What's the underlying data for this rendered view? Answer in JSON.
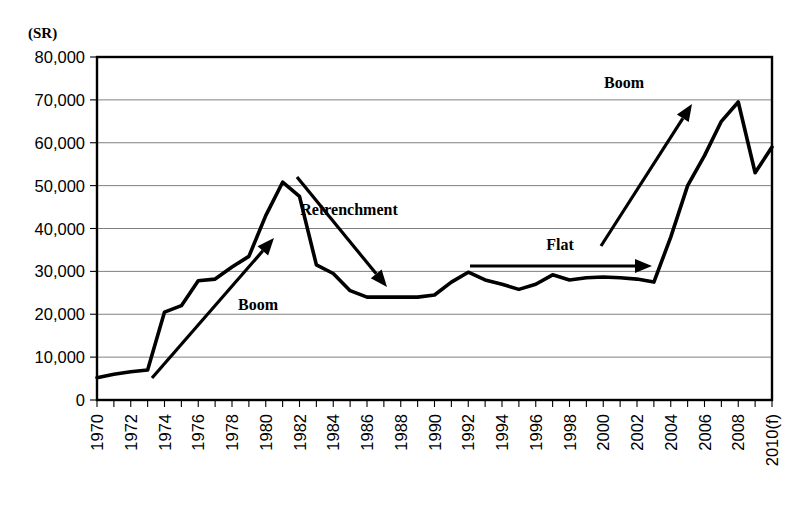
{
  "chart_data": {
    "type": "line",
    "title": "",
    "xlabel": "",
    "ylabel": "(SR)",
    "yunit_label": "(SR)",
    "ylim": [
      0,
      80000
    ],
    "ytick_values": [
      0,
      10000,
      20000,
      30000,
      40000,
      50000,
      60000,
      70000,
      80000
    ],
    "ytick_labels": [
      "0",
      "10,000",
      "20,000",
      "30,000",
      "40,000",
      "50,000",
      "60,000",
      "70,000",
      "80,000"
    ],
    "grid": true,
    "legend": "none",
    "xlim": [
      1970,
      2010
    ],
    "x": [
      1970,
      1971,
      1972,
      1973,
      1974,
      1975,
      1976,
      1977,
      1978,
      1979,
      1980,
      1981,
      1982,
      1983,
      1984,
      1985,
      1986,
      1987,
      1988,
      1989,
      1990,
      1991,
      1992,
      1993,
      1994,
      1995,
      1996,
      1997,
      1998,
      1999,
      2000,
      2001,
      2002,
      2003,
      2004,
      2005,
      2006,
      2007,
      2008,
      2009,
      2010
    ],
    "xtick_labels": [
      "1970",
      "",
      "1972",
      "",
      "1974",
      "",
      "1976",
      "",
      "1978",
      "",
      "1980",
      "",
      "1982",
      "",
      "1984",
      "",
      "1986",
      "",
      "1988",
      "",
      "1990",
      "",
      "1992",
      "",
      "1994",
      "",
      "1996",
      "",
      "1998",
      "",
      "2000",
      "",
      "2002",
      "",
      "2004",
      "",
      "2006",
      "",
      "2008",
      "",
      "2010(f)"
    ],
    "values": [
      5200,
      6000,
      6600,
      7000,
      20500,
      22000,
      27800,
      28200,
      31000,
      33500,
      43000,
      50800,
      47500,
      31500,
      29500,
      25500,
      24000,
      24000,
      24000,
      24000,
      24500,
      27500,
      29800,
      28000,
      27000,
      25800,
      27000,
      29200,
      28000,
      28500,
      28700,
      28500,
      28200,
      27500,
      38000,
      50000,
      57000,
      65000,
      69500,
      53000,
      59000
    ],
    "series_name": "Value (SR)",
    "annotations": [
      {
        "label": "Boom",
        "label_x": 258,
        "label_y": 310,
        "x1": 152,
        "y1": 378,
        "x2": 274,
        "y2": 238
      },
      {
        "label": "Retrenchment",
        "label_x": 349,
        "label_y": 215,
        "x1": 297,
        "y1": 177,
        "x2": 387,
        "y2": 287
      },
      {
        "label": "Flat",
        "label_x": 560,
        "label_y": 250,
        "x1": 470,
        "y1": 266,
        "x2": 652,
        "y2": 266
      },
      {
        "label": "Boom",
        "label_x": 624,
        "label_y": 88,
        "x1": 601,
        "y1": 246,
        "x2": 692,
        "y2": 104
      }
    ],
    "colors": {
      "line": "#000000",
      "grid": "#808080",
      "frame": "#000000",
      "background": "#ffffff"
    }
  }
}
